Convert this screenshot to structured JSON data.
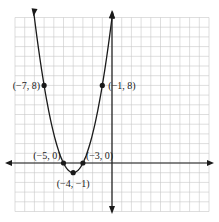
{
  "chart_data": {
    "type": "line",
    "title": "",
    "xlabel": "",
    "ylabel": "",
    "xlim": [
      -10,
      10
    ],
    "ylim": [
      -5,
      15
    ],
    "grid": true,
    "function": "y = (x + 4)^2 - 1",
    "series": [
      {
        "name": "parabola",
        "x": [
          -8.1,
          -7,
          -6,
          -5,
          -4,
          -3,
          -2,
          -1,
          0.1
        ],
        "y": [
          15.8,
          8,
          3,
          0,
          -1,
          0,
          3,
          8,
          15.8
        ]
      }
    ],
    "points": [
      {
        "x": -7,
        "y": 8,
        "label": "(−7, 8)"
      },
      {
        "x": -1,
        "y": 8,
        "label": "(−1, 8)"
      },
      {
        "x": -5,
        "y": 0,
        "label": "(−5, 0)"
      },
      {
        "x": -3,
        "y": 0,
        "label": "(−3, 0)"
      },
      {
        "x": -4,
        "y": -1,
        "label": "(−4, −1)"
      }
    ],
    "colors": {
      "curve": "#1a1a1a",
      "grid": "#c8c8c8",
      "axis": "#1a1a1a"
    }
  }
}
